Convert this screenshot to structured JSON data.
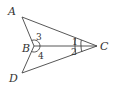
{
  "diagram": {
    "points": {
      "A": {
        "label": "A",
        "x": 22,
        "y": 17
      },
      "B": {
        "label": "B",
        "x": 34,
        "y": 46
      },
      "C": {
        "label": "C",
        "x": 97,
        "y": 46
      },
      "D": {
        "label": "D",
        "x": 22,
        "y": 73
      }
    },
    "segments": [
      [
        "A",
        "B"
      ],
      [
        "A",
        "C"
      ],
      [
        "B",
        "C"
      ],
      [
        "B",
        "D"
      ],
      [
        "D",
        "C"
      ]
    ],
    "angles": [
      {
        "label": "1",
        "vertex": "C"
      },
      {
        "label": "2",
        "vertex": "C"
      },
      {
        "label": "3",
        "vertex": "B"
      },
      {
        "label": "4",
        "vertex": "B"
      }
    ],
    "stroke_color": "#444444"
  }
}
